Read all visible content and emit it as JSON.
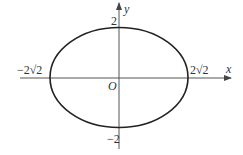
{
  "diagram": {
    "type": "ellipse-on-axes",
    "equation_implied": "x^2/8 + y^2/4 = 1",
    "axes": {
      "x_label": "x",
      "y_label": "y",
      "origin_label": "O"
    },
    "intercepts": {
      "x_left": "−2√2",
      "x_right": "2√2",
      "y_top": "2",
      "y_bottom": "−2"
    },
    "colors": {
      "stroke": "#222222",
      "axis": "#555555",
      "text": "#333333"
    }
  }
}
